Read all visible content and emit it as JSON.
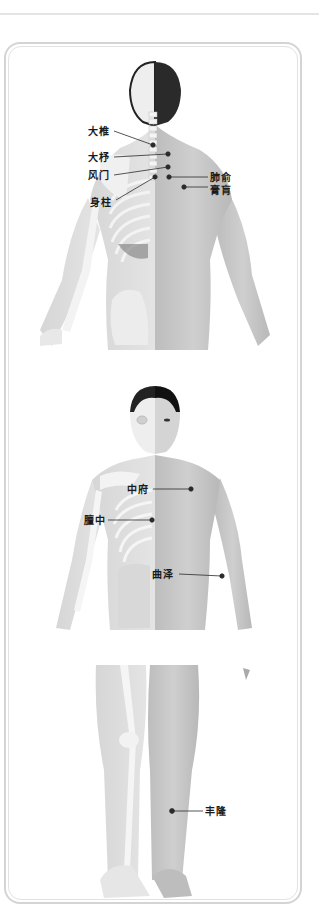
{
  "diagram": {
    "type": "acupoint-anatomy",
    "panels": [
      {
        "name": "back-view",
        "points": [
          {
            "label": "大椎",
            "label_x": 88,
            "label_y": 126,
            "dot_x": 153,
            "dot_y": 145,
            "line_from_x": 114,
            "line_from_y": 131
          },
          {
            "label": "大杼",
            "label_x": 88,
            "label_y": 152,
            "dot_x": 168,
            "dot_y": 154,
            "line_from_x": 114,
            "line_from_y": 157
          },
          {
            "label": "风门",
            "label_x": 88,
            "label_y": 170,
            "dot_x": 168,
            "dot_y": 167,
            "line_from_x": 114,
            "line_from_y": 175
          },
          {
            "label": "身柱",
            "label_x": 90,
            "label_y": 197,
            "dot_x": 155,
            "dot_y": 177,
            "line_from_x": 116,
            "line_from_y": 200
          },
          {
            "label": "肺俞",
            "label_x": 210,
            "label_y": 172,
            "dot_x": 169,
            "dot_y": 177,
            "line_from_x": 208,
            "line_from_y": 177
          },
          {
            "label": "膏肓",
            "label_x": 210,
            "label_y": 185,
            "dot_x": 184,
            "dot_y": 187,
            "line_from_x": 208,
            "line_from_y": 187
          }
        ]
      },
      {
        "name": "front-view",
        "points": [
          {
            "label": "中府",
            "label_x": 127,
            "label_y": 485,
            "dot_x": 191,
            "dot_y": 489,
            "line_from_x": 153,
            "line_from_y": 489
          },
          {
            "label": "膻中",
            "label_x": 84,
            "label_y": 515,
            "dot_x": 152,
            "dot_y": 520,
            "line_from_x": 108,
            "line_from_y": 520
          },
          {
            "label": "曲泽",
            "label_x": 152,
            "label_y": 569,
            "dot_x": 222,
            "dot_y": 576,
            "line_from_x": 179,
            "line_from_y": 574
          }
        ]
      },
      {
        "name": "leg-view",
        "points": [
          {
            "label": "丰隆",
            "label_x": 205,
            "label_y": 808,
            "dot_x": 172,
            "dot_y": 811,
            "line_from_x": 203,
            "line_from_y": 811
          }
        ]
      }
    ],
    "colors": {
      "frame": "#d4d4d4",
      "skin": "#c9c9c9",
      "bone": "#f2f2f2",
      "hair": "#2a2a2a",
      "dot": "#2b2b2b",
      "label": "#1a1a1a"
    }
  }
}
